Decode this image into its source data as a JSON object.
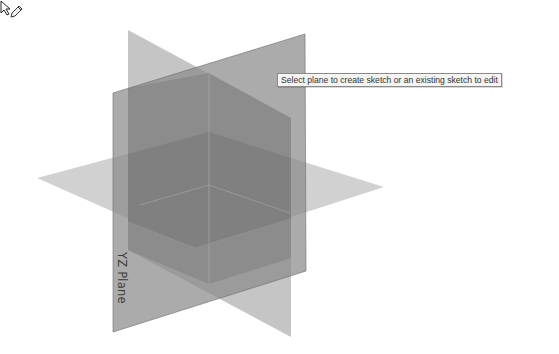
{
  "viewport": {
    "background": "#ffffff",
    "planes": [
      {
        "name": "XZ Plane",
        "label_visible": false,
        "fill": "#bdbdbd"
      },
      {
        "name": "XY Plane",
        "label_visible": false,
        "fill": "#cfcfcf"
      },
      {
        "name": "YZ Plane",
        "label_visible": true,
        "fill": "#8f8f8f"
      }
    ],
    "yz_plane_label": "YZ Plane"
  },
  "cursor": {
    "icon": "sketch-select-cursor-icon"
  },
  "tooltip": {
    "text": "Select plane to create sketch or an existing sketch to edit"
  }
}
